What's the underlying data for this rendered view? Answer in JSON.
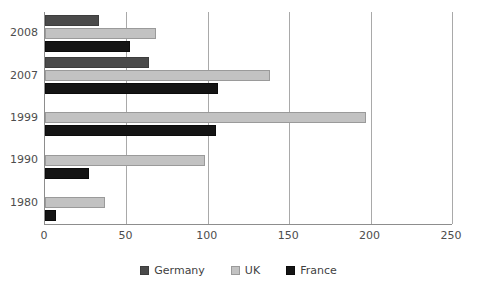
{
  "chart_data": {
    "type": "bar",
    "orientation": "horizontal",
    "title": "",
    "subtitle": "",
    "xlabel": "",
    "ylabel": "",
    "xlim": [
      0,
      250
    ],
    "ylim": null,
    "grid": "vertical",
    "legend_position": "bottom",
    "categories": [
      "2008",
      "2007",
      "1999",
      "1990",
      "1980"
    ],
    "xticks": [
      0,
      50,
      100,
      150,
      200,
      250
    ],
    "xticklabels": [
      "0",
      "50",
      "100",
      "150",
      "200",
      "250"
    ],
    "series": [
      {
        "name": "Germany",
        "color": "#4a4a4a",
        "values": [
          33,
          64,
          null,
          null,
          null
        ]
      },
      {
        "name": "UK",
        "color": "#c2c2c2",
        "values": [
          68,
          138,
          197,
          98,
          37
        ]
      },
      {
        "name": "France",
        "color": "#141414",
        "values": [
          52,
          106,
          105,
          27,
          7
        ]
      }
    ]
  },
  "legend": {
    "items": [
      {
        "label": "Germany",
        "key": "germany"
      },
      {
        "label": "UK",
        "key": "uk"
      },
      {
        "label": "France",
        "key": "france"
      }
    ]
  },
  "colors": {
    "germany": "#4a4a4a",
    "uk": "#c2c2c2",
    "france": "#141414",
    "axis": "#8d8d8d",
    "gridline": "#a9a9a9",
    "text": "#4d4d4d",
    "background": "#ffffff"
  }
}
